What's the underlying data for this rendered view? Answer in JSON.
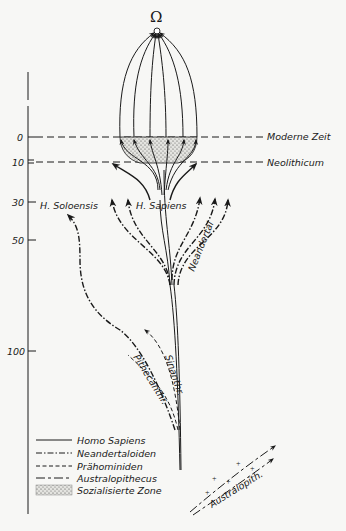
{
  "figure": {
    "top_symbol": "Ω",
    "axis": {
      "ticks": [
        {
          "label": "0",
          "y": 137
        },
        {
          "label": "10",
          "y": 162
        },
        {
          "label": "30",
          "y": 202
        },
        {
          "label": "50",
          "y": 240
        },
        {
          "label": "100",
          "y": 351
        }
      ]
    },
    "horizons": {
      "modern": "Moderne Zeit",
      "neolithic": "Neolithicum"
    },
    "branch_labels": {
      "soloensis": "H. Soloensis",
      "sapiens": "H. Sapiens",
      "neandertal": "Neandertal",
      "sinanthr": "Sinanthr.",
      "pithecanthr": "Pithecanthr.",
      "australopith": "Australopith."
    },
    "legend": [
      {
        "style": "solid",
        "label": "Homo Sapiens"
      },
      {
        "style": "dash-dot",
        "label": "Neandertaloiden"
      },
      {
        "style": "short-dash",
        "label": "Prähominiden"
      },
      {
        "style": "long-dash",
        "label": "Australopithecus"
      },
      {
        "style": "stipple",
        "label": "Sozialisierte Zone"
      }
    ]
  }
}
